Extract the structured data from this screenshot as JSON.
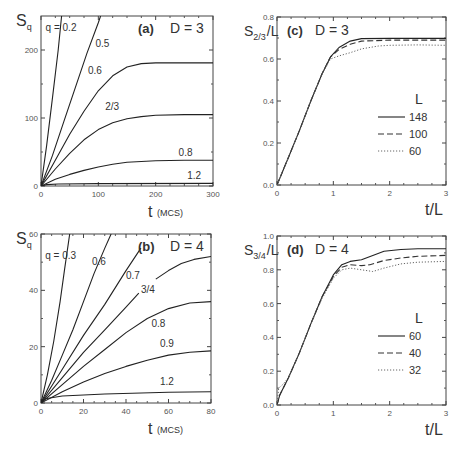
{
  "figure": {
    "panels": [
      "a",
      "b",
      "c",
      "d"
    ]
  },
  "chart_data": [
    {
      "panel": "(a)",
      "type": "line",
      "title": "D = 3",
      "xlabel": "t",
      "xlabel_unit": "(MCS)",
      "ylabel": "S",
      "ylabel_sub": "q",
      "xlim": [
        0,
        300
      ],
      "ylim": [
        0,
        250
      ],
      "xticks": [
        0,
        100,
        200,
        300
      ],
      "yticks": [
        0,
        100,
        200
      ],
      "frame": {
        "x0": 41,
        "x1": 213,
        "y0": 186,
        "y1": 16
      },
      "series": [
        {
          "name": "q = 0.2",
          "label": "q = 0.2",
          "label_pos": [
            8,
            228
          ],
          "points": [
            [
              0,
              0
            ],
            [
              10,
              60
            ],
            [
              20,
              130
            ],
            [
              30,
              200
            ],
            [
              36,
              250
            ]
          ]
        },
        {
          "name": "0.5",
          "label": "0.5",
          "label_pos": [
            95,
            205
          ],
          "points": [
            [
              0,
              0
            ],
            [
              20,
              45
            ],
            [
              40,
              95
            ],
            [
              60,
              145
            ],
            [
              80,
              195
            ],
            [
              100,
              240
            ],
            [
              104,
              250
            ]
          ]
        },
        {
          "name": "0.6",
          "label": "0.6",
          "label_pos": [
            82,
            165
          ],
          "points": [
            [
              0,
              0
            ],
            [
              25,
              38
            ],
            [
              50,
              76
            ],
            [
              75,
              110
            ],
            [
              100,
              140
            ],
            [
              125,
              162
            ],
            [
              150,
              175
            ],
            [
              175,
              180
            ],
            [
              200,
              181
            ],
            [
              250,
              181
            ],
            [
              300,
              181
            ]
          ]
        },
        {
          "name": "2/3",
          "label": "2/3",
          "label_pos": [
            112,
            112
          ],
          "points": [
            [
              0,
              0
            ],
            [
              25,
              25
            ],
            [
              50,
              48
            ],
            [
              75,
              68
            ],
            [
              100,
              83
            ],
            [
              125,
              93
            ],
            [
              150,
              99
            ],
            [
              175,
              102
            ],
            [
              200,
              104
            ],
            [
              250,
              105
            ],
            [
              300,
              105
            ]
          ]
        },
        {
          "name": "0.8",
          "label": "0.8",
          "label_pos": [
            240,
            44
          ],
          "points": [
            [
              0,
              0
            ],
            [
              25,
              10
            ],
            [
              50,
              17
            ],
            [
              75,
              23
            ],
            [
              100,
              28
            ],
            [
              125,
              32
            ],
            [
              150,
              35
            ],
            [
              175,
              36
            ],
            [
              200,
              37
            ],
            [
              250,
              38
            ],
            [
              300,
              38
            ]
          ]
        },
        {
          "name": "1.2",
          "label": "1.2",
          "label_pos": [
            255,
            10
          ],
          "points": [
            [
              0,
              0
            ],
            [
              10,
              2
            ],
            [
              30,
              3
            ],
            [
              100,
              3.5
            ],
            [
              300,
              3.8
            ]
          ]
        }
      ]
    },
    {
      "panel": "(b)",
      "type": "line",
      "title": "D = 4",
      "xlabel": "t",
      "xlabel_unit": "(MCS)",
      "ylabel": "S",
      "ylabel_sub": "q",
      "xlim": [
        0,
        80
      ],
      "ylim": [
        0,
        60
      ],
      "xticks": [
        0,
        20,
        40,
        60,
        80
      ],
      "yticks": [
        0,
        20,
        40,
        60
      ],
      "frame": {
        "x0": 41,
        "x1": 211,
        "y0": 403,
        "y1": 234
      },
      "series": [
        {
          "name": "q = 0.3",
          "label": "q = 0.3",
          "label_pos": [
            2,
            51
          ],
          "points": [
            [
              0,
              0
            ],
            [
              3,
              10
            ],
            [
              6,
              22
            ],
            [
              9,
              36
            ],
            [
              11,
              47
            ],
            [
              13.5,
              60
            ]
          ]
        },
        {
          "name": "0.6",
          "label": "0.6",
          "label_pos": [
            24,
            49
          ],
          "points": [
            [
              0,
              0
            ],
            [
              5,
              8
            ],
            [
              10,
              17
            ],
            [
              15,
              26
            ],
            [
              20,
              36
            ],
            [
              25,
              46
            ],
            [
              30,
              55
            ],
            [
              33,
              60
            ]
          ]
        },
        {
          "name": "0.7",
          "label": "0.7",
          "label_pos": [
            40,
            44
          ],
          "points": [
            [
              0,
              0
            ],
            [
              10,
              12
            ],
            [
              20,
              24
            ],
            [
              30,
              35
            ],
            [
              40,
              47
            ],
            [
              47,
              55
            ]
          ]
        },
        {
          "name": "3/4",
          "label": "3/4",
          "label_pos": [
            47,
            39
          ],
          "points": [
            [
              0,
              0
            ],
            [
              10,
              9
            ],
            [
              20,
              18
            ],
            [
              30,
              26
            ],
            [
              40,
              34
            ],
            [
              46,
              39
            ]
          ]
        },
        {
          "name": "3/4 (continued)",
          "label": "",
          "label_pos": null,
          "points": [
            [
              54,
              44
            ],
            [
              60,
              47
            ],
            [
              66,
              49.5
            ],
            [
              72,
              51
            ],
            [
              80,
              52
            ]
          ]
        },
        {
          "name": "0.8",
          "label": "0.8",
          "label_pos": [
            52,
            27
          ],
          "points": [
            [
              0,
              0
            ],
            [
              10,
              6.5
            ],
            [
              20,
              13
            ],
            [
              30,
              19
            ],
            [
              40,
              25
            ],
            [
              50,
              30
            ],
            [
              60,
              33.5
            ],
            [
              70,
              35.5
            ],
            [
              80,
              36
            ]
          ]
        },
        {
          "name": "0.9",
          "label": "0.9",
          "label_pos": [
            56,
            20
          ],
          "points": [
            [
              0,
              0
            ],
            [
              10,
              4
            ],
            [
              20,
              7.5
            ],
            [
              30,
              10.5
            ],
            [
              40,
              13
            ],
            [
              50,
              15.2
            ],
            [
              60,
              17
            ],
            [
              70,
              18
            ],
            [
              80,
              18.5
            ]
          ]
        },
        {
          "name": "1.2",
          "label": "1.2",
          "label_pos": [
            56,
            6.5
          ],
          "points": [
            [
              0,
              0
            ],
            [
              2,
              1.5
            ],
            [
              10,
              2.5
            ],
            [
              30,
              3.2
            ],
            [
              60,
              3.8
            ],
            [
              80,
              4
            ]
          ]
        }
      ]
    },
    {
      "panel": "(c)",
      "type": "line",
      "title": "D = 3",
      "xlabel": "t/L",
      "ylabel": "S",
      "ylabel_sub": "2/3",
      "ylabel_suffix": "/L",
      "xlim": [
        0,
        3
      ],
      "ylim": [
        0,
        0.8
      ],
      "xticks": [
        0,
        1,
        2,
        3
      ],
      "yticks": [
        0.0,
        0.2,
        0.4,
        0.6,
        0.8
      ],
      "ytick_labels": [
        "0.0",
        "0.2",
        "0.4",
        "0.6",
        "0.8"
      ],
      "frame": {
        "x0": 277,
        "x1": 446,
        "y0": 185,
        "y1": 17
      },
      "legend": {
        "title": "L",
        "position": "right-middle",
        "entries": [
          "148",
          "100",
          "60"
        ]
      },
      "series": [
        {
          "name": "148",
          "style": "solid",
          "points": [
            [
              0,
              0
            ],
            [
              0.2,
              0.13
            ],
            [
              0.4,
              0.26
            ],
            [
              0.6,
              0.4
            ],
            [
              0.8,
              0.53
            ],
            [
              0.95,
              0.61
            ],
            [
              1.1,
              0.655
            ],
            [
              1.3,
              0.685
            ],
            [
              1.5,
              0.697
            ],
            [
              2,
              0.698
            ],
            [
              2.5,
              0.698
            ],
            [
              3,
              0.698
            ]
          ]
        },
        {
          "name": "100",
          "style": "dashed",
          "points": [
            [
              0,
              0
            ],
            [
              0.2,
              0.13
            ],
            [
              0.4,
              0.26
            ],
            [
              0.6,
              0.4
            ],
            [
              0.8,
              0.53
            ],
            [
              0.95,
              0.61
            ],
            [
              1.1,
              0.645
            ],
            [
              1.3,
              0.67
            ],
            [
              1.5,
              0.685
            ],
            [
              2,
              0.69
            ],
            [
              2.5,
              0.69
            ],
            [
              3,
              0.69
            ]
          ]
        },
        {
          "name": "60",
          "style": "dotted",
          "points": [
            [
              0,
              0
            ],
            [
              0.2,
              0.13
            ],
            [
              0.4,
              0.26
            ],
            [
              0.6,
              0.4
            ],
            [
              0.8,
              0.53
            ],
            [
              0.95,
              0.6
            ],
            [
              1.1,
              0.615
            ],
            [
              1.3,
              0.63
            ],
            [
              1.5,
              0.648
            ],
            [
              1.8,
              0.662
            ],
            [
              2,
              0.665
            ],
            [
              2.5,
              0.667
            ],
            [
              3,
              0.665
            ]
          ]
        }
      ]
    },
    {
      "panel": "(d)",
      "type": "line",
      "title": "D = 4",
      "xlabel": "t/L",
      "ylabel": "S",
      "ylabel_sub": "3/4",
      "ylabel_suffix": "/L",
      "xlim": [
        0,
        3
      ],
      "ylim": [
        0,
        1.0
      ],
      "xticks": [
        0,
        1,
        2,
        3
      ],
      "yticks": [
        0.0,
        0.2,
        0.4,
        0.6,
        0.8,
        1.0
      ],
      "ytick_labels": [
        "0.0",
        "0.2",
        "0.4",
        "0.6",
        "0.8",
        "1.0"
      ],
      "frame": {
        "x0": 277,
        "x1": 446,
        "y0": 405,
        "y1": 236
      },
      "legend": {
        "title": "L",
        "position": "right-middle",
        "entries": [
          "60",
          "40",
          "32"
        ]
      },
      "series": [
        {
          "name": "60",
          "style": "solid",
          "points": [
            [
              0,
              0
            ],
            [
              0.05,
              0.06
            ],
            [
              0.2,
              0.16
            ],
            [
              0.4,
              0.31
            ],
            [
              0.6,
              0.48
            ],
            [
              0.8,
              0.64
            ],
            [
              1.0,
              0.77
            ],
            [
              1.15,
              0.83
            ],
            [
              1.3,
              0.85
            ],
            [
              1.5,
              0.86
            ],
            [
              1.7,
              0.885
            ],
            [
              1.9,
              0.91
            ],
            [
              2.2,
              0.92
            ],
            [
              2.5,
              0.925
            ],
            [
              3,
              0.925
            ]
          ]
        },
        {
          "name": "40",
          "style": "dashed",
          "points": [
            [
              0,
              0
            ],
            [
              0.05,
              0.06
            ],
            [
              0.2,
              0.16
            ],
            [
              0.4,
              0.31
            ],
            [
              0.6,
              0.48
            ],
            [
              0.8,
              0.64
            ],
            [
              1.0,
              0.76
            ],
            [
              1.15,
              0.815
            ],
            [
              1.3,
              0.83
            ],
            [
              1.5,
              0.825
            ],
            [
              1.65,
              0.83
            ],
            [
              1.9,
              0.855
            ],
            [
              2.2,
              0.87
            ],
            [
              2.5,
              0.88
            ],
            [
              3,
              0.885
            ]
          ]
        },
        {
          "name": "32",
          "style": "dotted",
          "points": [
            [
              0,
              0
            ],
            [
              0.03,
              0.1
            ],
            [
              0.1,
              0.12
            ],
            [
              0.2,
              0.16
            ],
            [
              0.4,
              0.31
            ],
            [
              0.6,
              0.48
            ],
            [
              0.8,
              0.63
            ],
            [
              1.0,
              0.75
            ],
            [
              1.15,
              0.8
            ],
            [
              1.3,
              0.81
            ],
            [
              1.5,
              0.8
            ],
            [
              1.7,
              0.79
            ],
            [
              1.9,
              0.81
            ],
            [
              2.2,
              0.835
            ],
            [
              2.5,
              0.845
            ],
            [
              3,
              0.85
            ]
          ]
        }
      ]
    }
  ]
}
